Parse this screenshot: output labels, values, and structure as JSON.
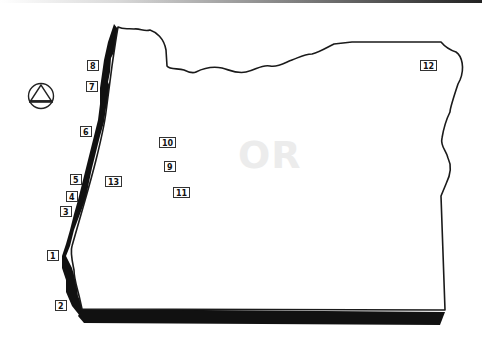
{
  "map": {
    "state_abbreviation": "OR",
    "colors": {
      "outline": "#1a1a1a",
      "coast_band": "#111111",
      "label_watermark": "#ececec",
      "background": "#ffffff"
    },
    "legend_symbol": "circle-with-triangle-icon",
    "markers": [
      {
        "id": "1",
        "label": "1",
        "x": 47,
        "y": 250
      },
      {
        "id": "2",
        "label": "2",
        "x": 55,
        "y": 300
      },
      {
        "id": "3",
        "label": "3",
        "x": 60,
        "y": 206
      },
      {
        "id": "4",
        "label": "4",
        "x": 66,
        "y": 191
      },
      {
        "id": "5",
        "label": "5",
        "x": 70,
        "y": 174
      },
      {
        "id": "6",
        "label": "6",
        "x": 80,
        "y": 126
      },
      {
        "id": "7",
        "label": "7",
        "x": 86,
        "y": 81
      },
      {
        "id": "8",
        "label": "8",
        "x": 87,
        "y": 60
      },
      {
        "id": "9",
        "label": "9",
        "x": 164,
        "y": 161
      },
      {
        "id": "10",
        "label": "10",
        "x": 159,
        "y": 137
      },
      {
        "id": "11",
        "label": "11",
        "x": 173,
        "y": 187
      },
      {
        "id": "12",
        "label": "12",
        "x": 420,
        "y": 60
      },
      {
        "id": "13",
        "label": "13",
        "x": 105,
        "y": 176
      }
    ]
  }
}
